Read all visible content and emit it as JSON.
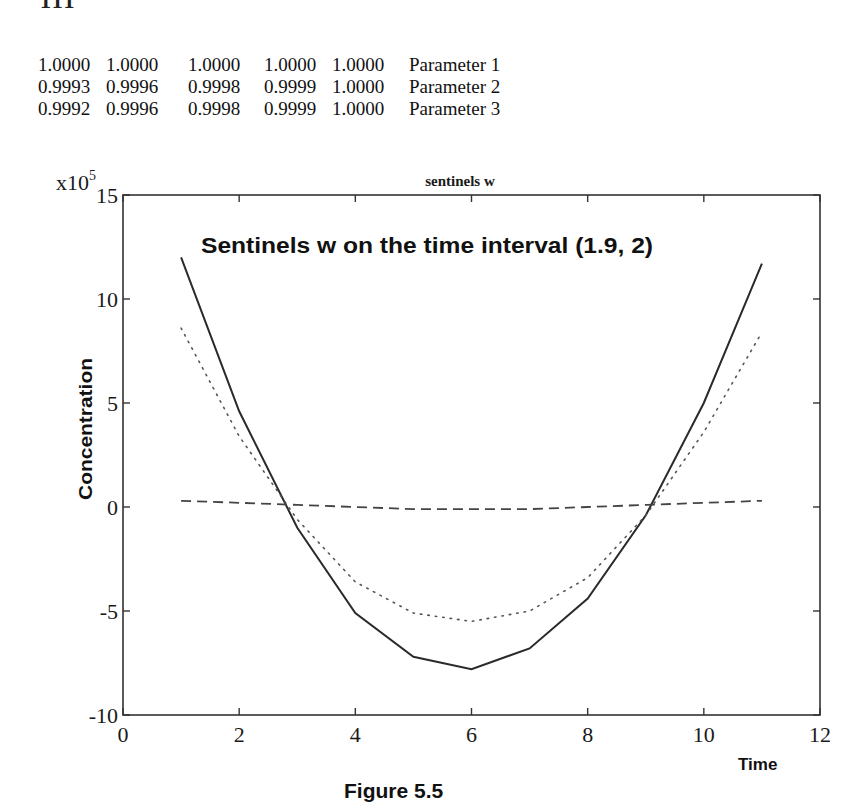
{
  "page": {
    "page_number": "111",
    "figure_caption": "Figure 5.5"
  },
  "parameter_table": {
    "rows": [
      {
        "values": [
          "1.0000",
          "1.0000",
          "1.0000",
          "1.0000",
          "1.0000"
        ],
        "label": "Parameter 1"
      },
      {
        "values": [
          "0.9993",
          "0.9996",
          "0.9998",
          "0.9999",
          "1.0000"
        ],
        "label": "Parameter 2"
      },
      {
        "values": [
          "0.9992",
          "0.9996",
          "0.9998",
          "0.9999",
          "1.0000"
        ],
        "label": "Parameter 3"
      }
    ]
  },
  "chart": {
    "small_title": "sentinels w",
    "inner_title": "Sentinels w on the time interval (1.9,  2)",
    "y_scale_base": "x10",
    "y_scale_exp": "5",
    "xlabel": "Time",
    "ylabel": "Concentration",
    "x_ticks": [
      "0",
      "2",
      "4",
      "6",
      "8",
      "10",
      "12"
    ],
    "y_ticks": [
      "15",
      "10",
      "5",
      "0",
      "-5",
      "-10"
    ]
  },
  "chart_data": {
    "type": "line",
    "title": "sentinels w",
    "subtitle": "Sentinels w on the time interval (1.9,  2)",
    "xlabel": "Time",
    "ylabel": "Concentration",
    "y_multiplier": "x10^5",
    "xlim": [
      0,
      12
    ],
    "ylim": [
      -10,
      15
    ],
    "x_ticks": [
      0,
      2,
      4,
      6,
      8,
      10,
      12
    ],
    "y_ticks": [
      -10,
      -5,
      0,
      5,
      10,
      15
    ],
    "grid": false,
    "legend": null,
    "x": [
      1,
      2,
      3,
      4,
      5,
      6,
      7,
      8,
      9,
      10,
      11
    ],
    "series": [
      {
        "name": "solid",
        "style": "solid",
        "values": [
          12.0,
          4.6,
          -1.0,
          -5.1,
          -7.2,
          -7.8,
          -6.8,
          -4.4,
          -0.4,
          5.0,
          11.7
        ]
      },
      {
        "name": "dotted",
        "style": "dotted",
        "values": [
          8.6,
          3.4,
          -0.6,
          -3.6,
          -5.1,
          -5.5,
          -5.0,
          -3.4,
          -0.4,
          3.6,
          8.4
        ]
      },
      {
        "name": "dashed",
        "style": "dashed",
        "values": [
          0.3,
          0.2,
          0.1,
          0.0,
          -0.1,
          -0.1,
          -0.1,
          0.0,
          0.1,
          0.2,
          0.3
        ]
      }
    ]
  }
}
